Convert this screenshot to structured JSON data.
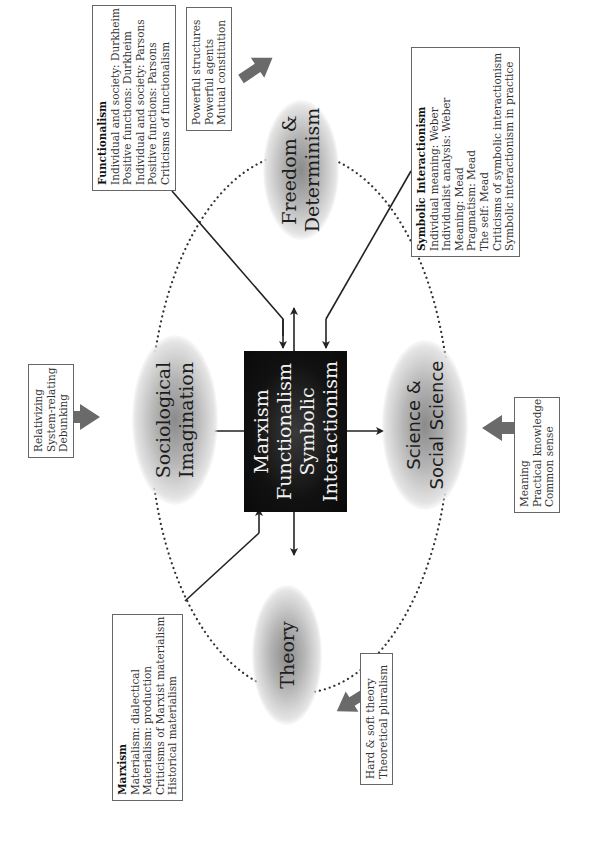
{
  "center": {
    "lines": [
      "Marxism",
      "Functionalism",
      "Symbolic",
      "Interactionism"
    ]
  },
  "themes": {
    "freedom": "Freedom &\nDeterminism",
    "sociological": "Sociological\nImagination",
    "science": "Science &\nSocial Science",
    "theory": "Theory"
  },
  "boxes": {
    "functionalism": {
      "title": "Functionalism",
      "items": [
        "Individual and society: Durkheim",
        "Positive functions: Durkheim",
        "Individual and society: Parsons",
        "Positive functions: Parsons",
        "Criticisms of functionalism"
      ]
    },
    "symbolic": {
      "title": "Symbolic Interactionism",
      "items": [
        "Individual meaning: Weber",
        "Individualist analysis: Weber",
        "Meaning: Mead",
        "Pragmatism: Mead",
        "The self: Mead",
        "Criticisms of symbolic interactionism",
        "Symbolic interactionism in practice"
      ]
    },
    "marxism": {
      "title": "Marxism",
      "items": [
        "Materialism: dialectical",
        "Materialism: production",
        "Criticisms of Marxist materialism",
        "Historical materialism"
      ]
    },
    "freedom_notes": {
      "items": [
        "Powerful structures",
        "Powerful agents",
        "Mutual constitution"
      ]
    },
    "sociological_notes": {
      "items": [
        "Relativizing",
        "System-relating",
        "Debunking"
      ]
    },
    "science_notes": {
      "items": [
        "Meaning",
        "Practical knowledge",
        "Common sense"
      ]
    },
    "theory_notes": {
      "items": [
        "Hard & soft theory",
        "Theoretical pluralism"
      ]
    }
  },
  "colors": {
    "center_fill": "#111111",
    "center_text": "#f2f2f2",
    "gray_arrow": "#6a6a6a",
    "line": "#222222",
    "box_border": "#666666"
  }
}
